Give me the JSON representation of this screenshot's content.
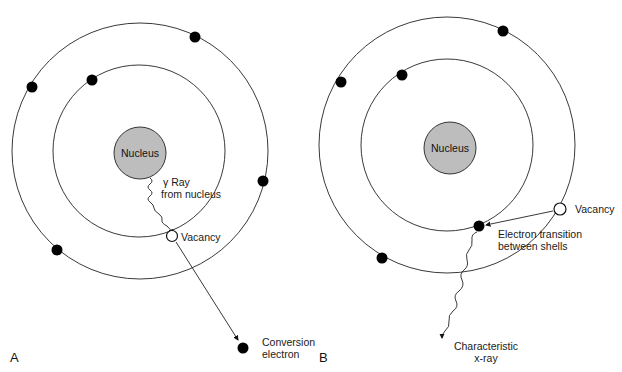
{
  "diagram": {
    "panels": [
      {
        "id": "A",
        "label": "A",
        "nucleus_label": "Nucleus",
        "gamma_label_line1": "γ Ray",
        "gamma_label_line2": "from nucleus",
        "vacancy_label": "Vacancy",
        "conversion_label_line1": "Conversion",
        "conversion_label_line2": "electron"
      },
      {
        "id": "B",
        "label": "B",
        "nucleus_label": "Nucleus",
        "vacancy_label": "Vacancy",
        "transition_label_line1": "Electron transition",
        "transition_label_line2": "between shells",
        "xray_label_line1": "Characteristic",
        "xray_label_line2": "x-ray"
      }
    ],
    "colors": {
      "nucleus_fill": "#bdbdbd",
      "stroke": "#222222",
      "electron": "#000000",
      "vacancy_fill": "#ffffff"
    }
  }
}
